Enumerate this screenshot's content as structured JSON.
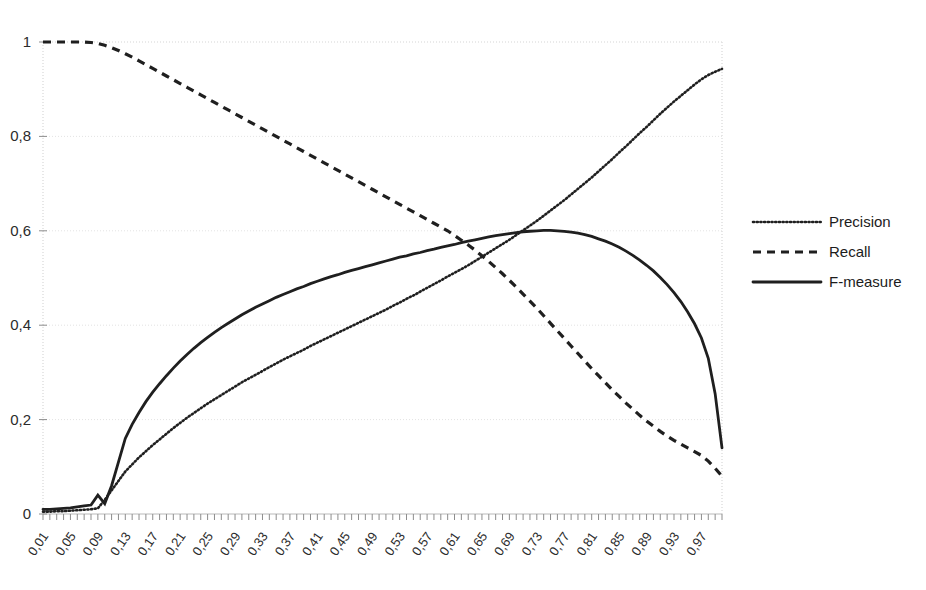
{
  "chart_data": {
    "type": "line",
    "title": "",
    "xlabel": "",
    "ylabel": "",
    "xlim": [
      0.01,
      1.0
    ],
    "ylim": [
      0,
      1
    ],
    "grid": true,
    "legend_position": "right",
    "y_tick_labels": [
      "1",
      "0,8",
      "0,6",
      "0,4",
      "0,2",
      "0"
    ],
    "y_tick_values": [
      1,
      0.8,
      0.6,
      0.4,
      0.2,
      0
    ],
    "x_tick_labels": [
      "0,01",
      "0,05",
      "0,09",
      "0,13",
      "0,17",
      "0,21",
      "0,25",
      "0,29",
      "0,33",
      "0,37",
      "0,41",
      "0,45",
      "0,49",
      "0,53",
      "0,57",
      "0,61",
      "0,65",
      "0,69",
      "0,73",
      "0,77",
      "0,81",
      "0,85",
      "0,89",
      "0,93",
      "0,97"
    ],
    "x_tick_values": [
      0.01,
      0.05,
      0.09,
      0.13,
      0.17,
      0.21,
      0.25,
      0.29,
      0.33,
      0.37,
      0.41,
      0.45,
      0.49,
      0.53,
      0.57,
      0.61,
      0.65,
      0.69,
      0.73,
      0.77,
      0.81,
      0.85,
      0.89,
      0.93,
      0.97
    ],
    "x": [
      0.01,
      0.02,
      0.03,
      0.04,
      0.05,
      0.06,
      0.07,
      0.08,
      0.09,
      0.1,
      0.11,
      0.12,
      0.13,
      0.14,
      0.15,
      0.16,
      0.17,
      0.18,
      0.19,
      0.2,
      0.21,
      0.22,
      0.23,
      0.24,
      0.25,
      0.26,
      0.27,
      0.28,
      0.29,
      0.3,
      0.31,
      0.32,
      0.33,
      0.34,
      0.35,
      0.36,
      0.37,
      0.38,
      0.39,
      0.4,
      0.41,
      0.42,
      0.43,
      0.44,
      0.45,
      0.46,
      0.47,
      0.48,
      0.49,
      0.5,
      0.51,
      0.52,
      0.53,
      0.54,
      0.55,
      0.56,
      0.57,
      0.58,
      0.59,
      0.6,
      0.61,
      0.62,
      0.63,
      0.64,
      0.65,
      0.66,
      0.67,
      0.68,
      0.69,
      0.7,
      0.71,
      0.72,
      0.73,
      0.74,
      0.75,
      0.76,
      0.77,
      0.78,
      0.79,
      0.8,
      0.81,
      0.82,
      0.83,
      0.84,
      0.85,
      0.86,
      0.87,
      0.88,
      0.89,
      0.9,
      0.91,
      0.92,
      0.93,
      0.94,
      0.95,
      0.96,
      0.97,
      0.98,
      0.99,
      1.0
    ],
    "series": [
      {
        "name": "Precision",
        "style": "dotted",
        "color": "#1f1f1f",
        "values": [
          0.005,
          0.005,
          0.006,
          0.006,
          0.007,
          0.008,
          0.009,
          0.01,
          0.012,
          0.03,
          0.05,
          0.07,
          0.09,
          0.105,
          0.12,
          0.133,
          0.146,
          0.158,
          0.17,
          0.182,
          0.193,
          0.204,
          0.214,
          0.224,
          0.234,
          0.243,
          0.252,
          0.261,
          0.27,
          0.279,
          0.287,
          0.295,
          0.303,
          0.311,
          0.319,
          0.327,
          0.334,
          0.341,
          0.348,
          0.356,
          0.363,
          0.37,
          0.377,
          0.384,
          0.391,
          0.398,
          0.405,
          0.412,
          0.419,
          0.426,
          0.433,
          0.441,
          0.448,
          0.456,
          0.463,
          0.471,
          0.479,
          0.487,
          0.495,
          0.503,
          0.511,
          0.519,
          0.527,
          0.536,
          0.545,
          0.554,
          0.563,
          0.572,
          0.581,
          0.591,
          0.601,
          0.611,
          0.621,
          0.632,
          0.643,
          0.654,
          0.665,
          0.677,
          0.689,
          0.701,
          0.713,
          0.726,
          0.739,
          0.752,
          0.766,
          0.779,
          0.793,
          0.807,
          0.82,
          0.834,
          0.848,
          0.861,
          0.874,
          0.886,
          0.898,
          0.91,
          0.921,
          0.93,
          0.937,
          0.943
        ]
      },
      {
        "name": "Recall",
        "style": "dashed",
        "color": "#1f1f1f",
        "values": [
          1.0,
          1.0,
          1.0,
          1.0,
          1.0,
          1.0,
          1.0,
          0.999,
          0.997,
          0.993,
          0.988,
          0.982,
          0.975,
          0.968,
          0.96,
          0.952,
          0.944,
          0.936,
          0.928,
          0.92,
          0.912,
          0.904,
          0.896,
          0.888,
          0.88,
          0.872,
          0.864,
          0.856,
          0.848,
          0.84,
          0.832,
          0.824,
          0.816,
          0.808,
          0.8,
          0.792,
          0.784,
          0.776,
          0.768,
          0.76,
          0.752,
          0.744,
          0.736,
          0.728,
          0.72,
          0.712,
          0.704,
          0.696,
          0.688,
          0.68,
          0.672,
          0.664,
          0.656,
          0.648,
          0.64,
          0.632,
          0.624,
          0.616,
          0.608,
          0.6,
          0.59,
          0.58,
          0.57,
          0.559,
          0.547,
          0.535,
          0.522,
          0.509,
          0.495,
          0.481,
          0.466,
          0.451,
          0.436,
          0.42,
          0.404,
          0.388,
          0.372,
          0.356,
          0.34,
          0.324,
          0.308,
          0.293,
          0.278,
          0.263,
          0.249,
          0.235,
          0.222,
          0.209,
          0.197,
          0.186,
          0.175,
          0.165,
          0.156,
          0.148,
          0.14,
          0.132,
          0.124,
          0.112,
          0.097,
          0.08
        ]
      },
      {
        "name": "F-measure",
        "style": "solid",
        "color": "#1f1f1f",
        "values": [
          0.01,
          0.01,
          0.011,
          0.012,
          0.013,
          0.015,
          0.017,
          0.019,
          0.04,
          0.022,
          0.06,
          0.11,
          0.16,
          0.19,
          0.215,
          0.238,
          0.258,
          0.276,
          0.293,
          0.309,
          0.324,
          0.338,
          0.351,
          0.363,
          0.374,
          0.385,
          0.395,
          0.404,
          0.413,
          0.422,
          0.43,
          0.438,
          0.445,
          0.452,
          0.459,
          0.465,
          0.471,
          0.477,
          0.482,
          0.488,
          0.493,
          0.498,
          0.503,
          0.507,
          0.512,
          0.516,
          0.52,
          0.524,
          0.528,
          0.532,
          0.536,
          0.54,
          0.544,
          0.547,
          0.551,
          0.554,
          0.558,
          0.561,
          0.565,
          0.568,
          0.571,
          0.575,
          0.578,
          0.581,
          0.584,
          0.587,
          0.59,
          0.592,
          0.594,
          0.596,
          0.598,
          0.599,
          0.6,
          0.601,
          0.601,
          0.6,
          0.599,
          0.597,
          0.595,
          0.592,
          0.588,
          0.583,
          0.578,
          0.572,
          0.565,
          0.557,
          0.548,
          0.538,
          0.527,
          0.515,
          0.501,
          0.486,
          0.469,
          0.45,
          0.428,
          0.403,
          0.373,
          0.33,
          0.255,
          0.14
        ]
      }
    ]
  },
  "legend": {
    "items": [
      {
        "label": "Precision",
        "marker": "dotted-line-icon"
      },
      {
        "label": "Recall",
        "marker": "dashed-line-icon"
      },
      {
        "label": "F-measure",
        "marker": "solid-line-icon"
      }
    ]
  }
}
